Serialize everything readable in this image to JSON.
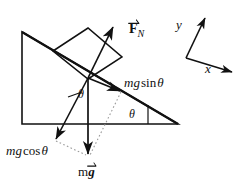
{
  "diagram": {
    "colors": {
      "stroke": "#111111",
      "background": "#ffffff",
      "dotted": "#9a9a9a"
    },
    "labels": {
      "normal_force": {
        "symbol": "F",
        "subscript": "N",
        "vector": true
      },
      "mg_sin_theta": {
        "prefix": "mg",
        "func": "sin",
        "angle": "θ"
      },
      "mg_cos_theta": {
        "prefix": "mg",
        "func": "cos",
        "angle": "θ"
      },
      "weight": {
        "mass": "m",
        "symbol": "g",
        "vector": true
      },
      "axis_y": "y",
      "axis_x": "x",
      "angle_at_vectors": "θ",
      "angle_at_incline": "θ"
    },
    "geometry": {
      "incline": {
        "apex": [
          22,
          32
        ],
        "bottom_left": [
          22,
          124
        ],
        "bottom_right": [
          178,
          124
        ]
      },
      "block": {
        "points": [
          [
            53,
            51
          ],
          [
            88,
            28
          ],
          [
            122,
            57
          ],
          [
            88,
            79
          ]
        ]
      },
      "force_origin": [
        88,
        78
      ],
      "vectors": [
        {
          "name": "normal-force",
          "from": [
            88,
            78
          ],
          "to": [
            114,
            25
          ]
        },
        {
          "name": "mg-sin-theta",
          "from": [
            88,
            78
          ],
          "to": [
            123,
            93
          ]
        },
        {
          "name": "mg-cos-theta",
          "from": [
            88,
            78
          ],
          "to": [
            54,
            142
          ]
        },
        {
          "name": "weight",
          "from": [
            88,
            78
          ],
          "to": [
            88,
            158
          ]
        }
      ],
      "axes": {
        "origin": [
          186,
          58
        ],
        "y_tip": [
          207,
          16
        ],
        "x_tip": [
          235,
          74
        ]
      },
      "dotted_lines": [
        {
          "from": [
            123,
            93
          ],
          "to": [
            88,
            158
          ]
        },
        {
          "from": [
            54,
            142
          ],
          "to": [
            88,
            158
          ]
        }
      ]
    }
  }
}
